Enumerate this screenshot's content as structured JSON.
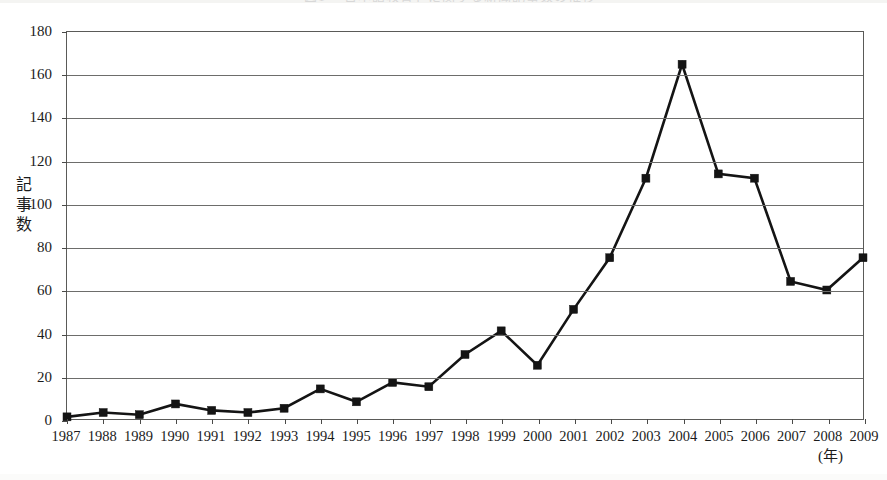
{
  "chart_data": {
    "type": "line",
    "title": "図1 「日本語教育」に関する新聞記事数の推移",
    "xlabel": "(年)",
    "ylabel": "記事数",
    "categories": [
      "1987",
      "1988",
      "1989",
      "1990",
      "1991",
      "1992",
      "1993",
      "1994",
      "1995",
      "1996",
      "1997",
      "1998",
      "1999",
      "2000",
      "2001",
      "2002",
      "2003",
      "2004",
      "2005",
      "2006",
      "2007",
      "2008",
      "2009"
    ],
    "values": [
      1,
      3,
      2,
      7,
      4,
      3,
      5,
      14,
      8,
      17,
      15,
      30,
      41,
      25,
      51,
      75,
      112,
      165,
      114,
      112,
      64,
      60,
      75
    ],
    "series": [
      {
        "name": "記事数",
        "values": [
          1,
          3,
          2,
          7,
          4,
          3,
          5,
          14,
          8,
          17,
          15,
          30,
          41,
          25,
          51,
          75,
          112,
          165,
          114,
          112,
          64,
          60,
          75
        ],
        "marker": "square",
        "color": "#141414"
      }
    ],
    "ylim": [
      0,
      180
    ],
    "ytick_values": [
      0,
      20,
      40,
      60,
      80,
      100,
      120,
      140,
      160,
      180
    ],
    "ytick_labels": [
      "0",
      "20",
      "40",
      "60",
      "80",
      "100",
      "120",
      "140",
      "160",
      "180"
    ],
    "grid": true,
    "grid_axis": "y",
    "legend": false,
    "legend_position": "none",
    "frame": true,
    "line_color": "#141414",
    "grid_color": "#6d6d6b",
    "frame_color": "#5a5a58",
    "background_color": "#ffffff"
  }
}
